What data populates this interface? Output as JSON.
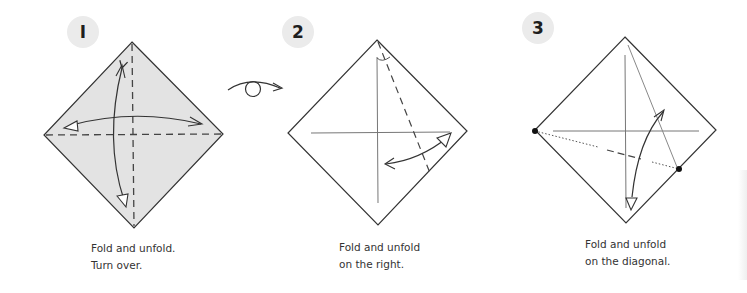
{
  "steps": [
    {
      "number": "1",
      "badge_label": "I",
      "caption_line1": "Fold and unfold.",
      "caption_line2": "Turn over.",
      "paper_color": "#e3e3e3",
      "icons": [
        "diamond-paper-shaded",
        "dashed-vertical-crease",
        "dashed-horizontal-crease",
        "curved-double-arrow-vertical",
        "curved-double-arrow-horizontal"
      ]
    },
    {
      "number": "2",
      "badge_label": "2",
      "caption_line1": "Fold and unfold",
      "caption_line2": "on the right.",
      "paper_color": "#ffffff",
      "icons": [
        "diamond-paper",
        "crease-lines",
        "dashed-angle-bisector",
        "angle-mark",
        "curved-double-arrow"
      ]
    },
    {
      "number": "3",
      "badge_label": "3",
      "caption_line1": "Fold and unfold",
      "caption_line2": "on the diagonal.",
      "paper_color": "#ffffff",
      "icons": [
        "diamond-paper",
        "crease-lines",
        "dotted-fold-line",
        "reference-dots",
        "curved-double-arrow"
      ]
    }
  ],
  "between_steps_symbol": "turn-over-icon",
  "colors": {
    "line": "#2a2a2a",
    "crease": "#6a6a6a",
    "badge_bg": "#ebebeb",
    "badge_text": "#1e1e1e",
    "caption_text": "#333333"
  }
}
